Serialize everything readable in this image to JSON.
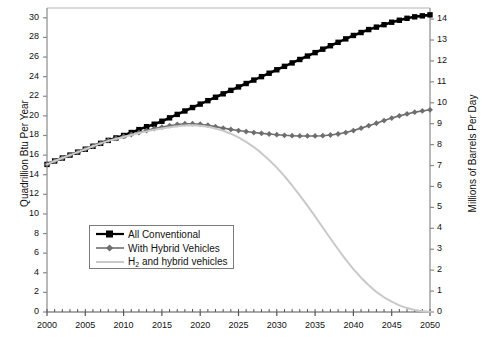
{
  "chart_data": {
    "type": "line",
    "title": "",
    "xlabel": "",
    "ylabel": "Quadrillion Btu Per Year",
    "y2label": "Millions of Barrels Per Day",
    "xlim": [
      2000,
      2050
    ],
    "ylim": [
      0,
      31
    ],
    "y2lim": [
      0,
      14.53
    ],
    "grid": false,
    "legend_position": "center-left",
    "x_tick_labels": [
      "2000",
      "2005",
      "2010",
      "2015",
      "2020",
      "2025",
      "2030",
      "2035",
      "2040",
      "2045",
      "2050"
    ],
    "x_tick_values": [
      2000,
      2005,
      2010,
      2015,
      2020,
      2025,
      2030,
      2035,
      2040,
      2045,
      2050
    ],
    "x_minor_tick_step": 1,
    "y_tick_labels": [
      "0",
      "2",
      "4",
      "6",
      "8",
      "10",
      "12",
      "14",
      "16",
      "18",
      "20",
      "22",
      "24",
      "26",
      "28",
      "30"
    ],
    "y_tick_values": [
      0,
      2,
      4,
      6,
      8,
      10,
      12,
      14,
      16,
      18,
      20,
      22,
      24,
      26,
      28,
      30
    ],
    "y2_tick_labels": [
      "0",
      "1",
      "2",
      "3",
      "4",
      "5",
      "6",
      "7",
      "8",
      "9",
      "10",
      "11",
      "12",
      "13",
      "14"
    ],
    "y2_tick_values": [
      0,
      1,
      2,
      3,
      4,
      5,
      6,
      7,
      8,
      9,
      10,
      11,
      12,
      13,
      14
    ],
    "x": [
      2000,
      2001,
      2002,
      2003,
      2004,
      2005,
      2006,
      2007,
      2008,
      2009,
      2010,
      2011,
      2012,
      2013,
      2014,
      2015,
      2016,
      2017,
      2018,
      2019,
      2020,
      2021,
      2022,
      2023,
      2024,
      2025,
      2026,
      2027,
      2028,
      2029,
      2030,
      2031,
      2032,
      2033,
      2034,
      2035,
      2036,
      2037,
      2038,
      2039,
      2040,
      2041,
      2042,
      2043,
      2044,
      2045,
      2046,
      2047,
      2048,
      2049,
      2050
    ],
    "series": [
      {
        "name": "All Conventional",
        "color": "#000000",
        "marker": "square",
        "values": [
          15.05,
          15.4,
          15.7,
          16.0,
          16.3,
          16.6,
          16.9,
          17.2,
          17.5,
          17.75,
          18.0,
          18.3,
          18.6,
          18.9,
          19.15,
          19.45,
          19.8,
          20.15,
          20.5,
          20.85,
          21.2,
          21.55,
          21.9,
          22.25,
          22.6,
          22.95,
          23.3,
          23.65,
          24.0,
          24.35,
          24.7,
          25.05,
          25.4,
          25.75,
          26.1,
          26.45,
          26.8,
          27.15,
          27.5,
          27.85,
          28.2,
          28.5,
          28.8,
          29.05,
          29.3,
          29.55,
          29.75,
          29.95,
          30.1,
          30.2,
          30.3
        ]
      },
      {
        "name": "With Hybrid Vehicles",
        "color": "#6e6e6e",
        "marker": "diamond",
        "values": [
          15.05,
          15.4,
          15.7,
          16.0,
          16.3,
          16.6,
          16.9,
          17.2,
          17.5,
          17.7,
          17.9,
          18.1,
          18.3,
          18.5,
          18.7,
          18.85,
          19.0,
          19.12,
          19.2,
          19.2,
          19.15,
          19.05,
          18.9,
          18.75,
          18.62,
          18.5,
          18.4,
          18.3,
          18.22,
          18.15,
          18.08,
          18.02,
          17.98,
          17.95,
          17.95,
          17.95,
          17.98,
          18.05,
          18.15,
          18.3,
          18.5,
          18.75,
          19.0,
          19.25,
          19.52,
          19.78,
          20.0,
          20.2,
          20.38,
          20.5,
          20.62
        ]
      },
      {
        "name": "H2 and hybrid vehicles",
        "color": "#c9c9c9",
        "marker": "none",
        "values": [
          15.05,
          15.4,
          15.7,
          16.0,
          16.3,
          16.6,
          16.9,
          17.2,
          17.45,
          17.65,
          17.85,
          18.05,
          18.25,
          18.42,
          18.58,
          18.72,
          18.85,
          18.95,
          19.02,
          19.05,
          19.0,
          18.9,
          18.72,
          18.48,
          18.18,
          17.8,
          17.35,
          16.82,
          16.2,
          15.5,
          14.72,
          13.85,
          12.9,
          11.9,
          10.85,
          9.75,
          8.62,
          7.5,
          6.4,
          5.35,
          4.38,
          3.5,
          2.72,
          2.05,
          1.5,
          1.05,
          0.68,
          0.4,
          0.2,
          0.08,
          0.02
        ]
      }
    ]
  },
  "legend": {
    "items": [
      {
        "label": "All Conventional"
      },
      {
        "label": "With Hybrid Vehicles"
      },
      {
        "label_prefix": "H",
        "label_sub": "2",
        "label_suffix": " and hybrid vehicles"
      }
    ]
  }
}
